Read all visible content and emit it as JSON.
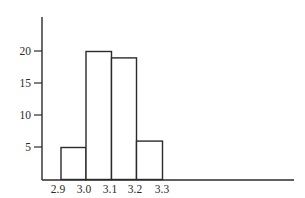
{
  "chart_data": {
    "type": "bar",
    "subtype": "histogram",
    "title": "",
    "xlabel": "",
    "ylabel": "",
    "bin_edges": [
      2.9,
      3.0,
      3.1,
      3.2,
      3.3
    ],
    "categories": [
      "2.9-3.0",
      "3.0-3.1",
      "3.1-3.2",
      "3.2-3.3"
    ],
    "values": [
      5,
      20,
      19,
      6
    ],
    "x_tick_labels": [
      "2.9",
      "3.0",
      "3.1",
      "3.2",
      "3.3"
    ],
    "y_tick_labels": [
      "5",
      "10",
      "15",
      "20"
    ],
    "y_ticks": [
      5,
      10,
      15,
      20
    ],
    "ylim": [
      0,
      24
    ],
    "grid": false,
    "legend": null,
    "bar_fill": "#ffffff",
    "bar_stroke": "#2b2b2b"
  },
  "labels": {
    "x": [
      "2.9",
      "3.0",
      "3.1",
      "3.2",
      "3.3"
    ],
    "y": [
      "20",
      "15",
      "10",
      "5"
    ]
  }
}
